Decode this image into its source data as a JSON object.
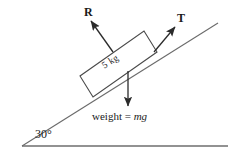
{
  "figure": {
    "background_color": "#ffffff",
    "line_color": "#2b2b2b",
    "text_color": "#1a1a1a"
  },
  "labels": {
    "normal_force": "R",
    "tension": "T",
    "mass": "5 kg",
    "weight_text": "weight = ",
    "weight_symbol": "mg",
    "angle": "30°"
  },
  "geometry": {
    "incline_angle_degrees": 30,
    "baseline": {
      "x1": 22,
      "y1": 146,
      "x2": 228,
      "y2": 146
    },
    "incline": {
      "x1": 22,
      "y1": 146,
      "x2": 218,
      "y2": 23
    },
    "block_corners": [
      {
        "x": 93,
        "y": 97
      },
      {
        "x": 80,
        "y": 76
      },
      {
        "x": 144,
        "y": 31
      },
      {
        "x": 157,
        "y": 52
      }
    ],
    "normal_arrow": {
      "x1": 113,
      "y1": 52,
      "x2": 90,
      "y2": 20
    },
    "tension_arrow": {
      "x1": 154,
      "y1": 52,
      "x2": 176,
      "y2": 26
    },
    "weight_arrow": {
      "x1": 128,
      "y1": 71,
      "x2": 128,
      "y2": 108
    }
  }
}
